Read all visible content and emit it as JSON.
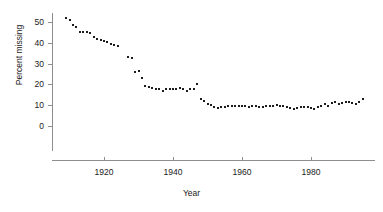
{
  "chart_data": {
    "type": "scatter",
    "title": "",
    "xlabel": "Year",
    "ylabel": "Percent missing",
    "xlim": [
      1906,
      1997
    ],
    "ylim": [
      0,
      54
    ],
    "xticks": [
      1920,
      1940,
      1960,
      1980
    ],
    "xtick_labels": [
      "1920",
      "1940",
      "1960",
      "1980"
    ],
    "yticks": [
      0,
      10,
      20,
      30,
      40,
      50
    ],
    "ytick_labels": [
      "0",
      "10",
      "20",
      "30",
      "40",
      "50"
    ],
    "grid": false,
    "legend": false,
    "legend_position": "none",
    "marker": "square",
    "marker_color": "#1c1c1c",
    "series": [
      {
        "name": "Percent missing",
        "x": [
          1909,
          1910,
          1911,
          1912,
          1913,
          1914,
          1915,
          1916,
          1917,
          1918,
          1919,
          1920,
          1921,
          1922,
          1923,
          1924,
          1927,
          1928,
          1929,
          1930,
          1931,
          1932,
          1933,
          1934,
          1935,
          1936,
          1937,
          1938,
          1939,
          1940,
          1941,
          1942,
          1943,
          1944,
          1945,
          1946,
          1947,
          1948,
          1949,
          1950,
          1951,
          1952,
          1953,
          1954,
          1955,
          1956,
          1957,
          1958,
          1959,
          1960,
          1961,
          1962,
          1963,
          1964,
          1965,
          1966,
          1967,
          1968,
          1969,
          1970,
          1971,
          1972,
          1973,
          1974,
          1975,
          1976,
          1977,
          1978,
          1979,
          1980,
          1981,
          1982,
          1983,
          1984,
          1985,
          1986,
          1987,
          1988,
          1989,
          1990,
          1991,
          1992,
          1993,
          1994,
          1995
        ],
        "y": [
          52.0,
          51.0,
          48.5,
          47.5,
          45.3,
          45.2,
          45.0,
          44.5,
          43.0,
          42.0,
          41.5,
          41.0,
          40.3,
          39.6,
          39.0,
          38.3,
          33.2,
          32.5,
          26.0,
          26.5,
          23.3,
          19.0,
          18.8,
          18.5,
          18.0,
          17.6,
          17.0,
          17.8,
          18.0,
          17.8,
          18.0,
          18.2,
          17.8,
          17.0,
          17.6,
          17.8,
          20.3,
          13.0,
          12.0,
          10.6,
          10.0,
          9.3,
          8.8,
          9.2,
          9.3,
          9.5,
          9.7,
          9.8,
          9.6,
          9.8,
          9.5,
          9.3,
          9.5,
          9.6,
          9.2,
          9.0,
          9.5,
          9.8,
          9.5,
          9.9,
          9.6,
          9.4,
          9.0,
          8.7,
          8.2,
          8.5,
          9.0,
          9.2,
          9.0,
          8.6,
          8.3,
          9.0,
          9.5,
          10.5,
          9.8,
          11.0,
          11.5,
          10.8,
          11.2,
          11.5,
          11.3,
          11.0,
          10.6,
          11.4,
          13.2
        ]
      }
    ]
  },
  "axis": {
    "x_title": "Year",
    "y_title": "Percent missing"
  }
}
